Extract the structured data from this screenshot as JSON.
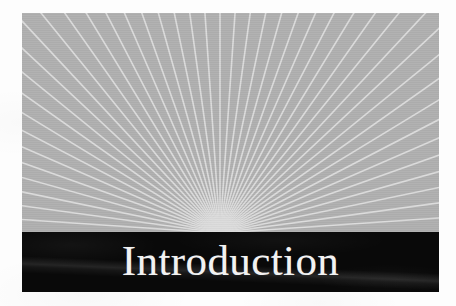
{
  "page": {
    "background_color": "#fdfdfd",
    "kind": "book-chapter-opener"
  },
  "opener": {
    "title": "Introduction",
    "title_color": "#f2f2f2",
    "band_color": "#090909",
    "field_color": "#b0b0b0",
    "ray_color": "#dcdcdc"
  },
  "chart_data": {
    "type": "sunburst-rays",
    "title": "Introduction",
    "origin": {
      "x": 198,
      "y": 220
    },
    "ray_count": 47,
    "angle_start_deg": 180,
    "angle_end_deg": 360,
    "ray_length": 700,
    "ray_width_px": 1.6,
    "background": "#b0b0b0",
    "ray_color": "#dcdcdc",
    "grid": false,
    "legend": false
  }
}
